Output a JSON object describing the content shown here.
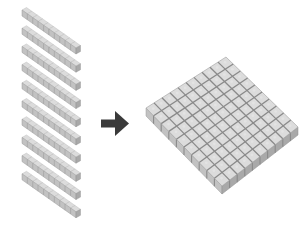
{
  "diagram": {
    "rods": {
      "count": 10,
      "cubes_per_rod": 10,
      "start": [
        22,
        10
      ],
      "end": [
        76,
        48
      ],
      "spacing_y": 18.2,
      "thickness": 6
    },
    "arrow": {
      "direction": "right",
      "color": "#3a3a3a"
    },
    "flat": {
      "grid": 10,
      "corners": {
        "top": [
          226,
          57
        ],
        "left": [
          146,
          108
        ],
        "bottom": [
          222,
          186
        ],
        "right": [
          298,
          127
        ]
      },
      "depth": 8
    },
    "colors": {
      "cube_top": "#dcdcdc",
      "cube_front": "#c2c2c2",
      "cube_side": "#a9a9a9",
      "grid_line": "#8a8a8a",
      "arrow": "#3a3a3a",
      "background": "#ffffff"
    }
  }
}
